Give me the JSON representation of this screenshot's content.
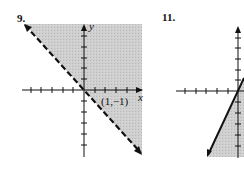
{
  "problems": [
    {
      "number": "9.",
      "graph": {
        "boundary": "dashed",
        "shading": "above-right of line",
        "axis_labels": {
          "x": "x",
          "y": "y"
        },
        "point_label": "(1,−1)"
      }
    },
    {
      "number": "11.",
      "graph": {
        "boundary": "solid",
        "shading": "right of line",
        "axis_labels": {
          "x": "",
          "y": ""
        }
      }
    }
  ],
  "colors": {
    "shade": "#c8c8c8",
    "ink": "#111111"
  }
}
